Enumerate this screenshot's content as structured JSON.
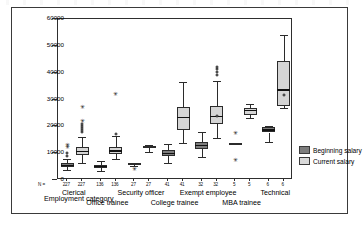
{
  "figure": {
    "xaxis_title": "Employment category",
    "n_prefix": "N ="
  },
  "legend": {
    "items": [
      {
        "label": "Beginning salary",
        "color": "#7d7d7d"
      },
      {
        "label": "Current salary",
        "color": "#d9d9d9"
      }
    ]
  },
  "chart_data": {
    "type": "box",
    "title": "",
    "xlabel": "Employment category",
    "ylabel": "",
    "ylim": [
      0,
      60000
    ],
    "yticks": [
      0,
      10000,
      20000,
      30000,
      40000,
      50000,
      60000
    ],
    "ytick_labels": [
      "0",
      "10000",
      "20000",
      "30000",
      "40000",
      "50000",
      "60000"
    ],
    "grid": false,
    "legend_position": "right",
    "categories": [
      "Clerical",
      "Office trainee",
      "Security officer",
      "College trainee",
      "Exempt employee",
      "MBA trainee",
      "Technical"
    ],
    "counts": [
      227,
      136,
      27,
      41,
      32,
      5,
      6
    ],
    "series": [
      {
        "name": "Beginning salary",
        "color": "#7d7d7d",
        "boxes": [
          {
            "category": "Clerical",
            "n": 227,
            "whisker_low": 3600,
            "q1": 4800,
            "median": 5400,
            "q3": 6300,
            "whisker_high": 8000,
            "outliers": [
              9000,
              10200,
              11800,
              12600
            ]
          },
          {
            "category": "Office trainee",
            "n": 136,
            "whisker_low": 3400,
            "q1": 4500,
            "median": 5100,
            "q3": 5700,
            "whisker_high": 7000,
            "outliers": []
          },
          {
            "category": "Security officer",
            "n": 27,
            "whisker_low": 5300,
            "q1": 5700,
            "median": 5900,
            "q3": 6100,
            "whisker_high": 6400,
            "outliers": [
              3800
            ]
          },
          {
            "category": "College trainee",
            "n": 41,
            "whisker_low": 6200,
            "q1": 8900,
            "median": 9800,
            "q3": 11200,
            "whisker_high": 13300,
            "outliers": []
          },
          {
            "category": "Exempt employee",
            "n": 32,
            "whisker_low": 8600,
            "q1": 11600,
            "median": 12800,
            "q3": 14200,
            "whisker_high": 17800,
            "outliers": []
          },
          {
            "category": "MBA trainee",
            "n": 5,
            "whisker_low": 13300,
            "q1": 13300,
            "median": 13400,
            "q3": 13500,
            "whisker_high": 13500,
            "outliers": [
              17000,
              7000
            ]
          },
          {
            "category": "Technical",
            "n": 6,
            "whisker_low": 14000,
            "q1": 17700,
            "median": 18600,
            "q3": 19800,
            "whisker_high": 20000,
            "outliers": []
          }
        ]
      },
      {
        "name": "Current salary",
        "color": "#d9d9d9",
        "boxes": [
          {
            "category": "Clerical",
            "n": 227,
            "whisker_low": 6500,
            "q1": 9400,
            "median": 10600,
            "q3": 12200,
            "whisker_high": 16000,
            "outliers": [
              17800,
              18600,
              19300,
              20000,
              20800,
              21500,
              26800
            ]
          },
          {
            "category": "Office trainee",
            "n": 136,
            "whisker_low": 7800,
            "q1": 9600,
            "median": 10700,
            "q3": 12200,
            "whisker_high": 16400,
            "outliers": [
              17300,
              31800
            ]
          },
          {
            "category": "Security officer",
            "n": 27,
            "whisker_low": 10400,
            "q1": 11800,
            "median": 12200,
            "q3": 12600,
            "whisker_high": 13100,
            "outliers": []
          },
          {
            "category": "College trainee",
            "n": 41,
            "whisker_low": 13800,
            "q1": 18600,
            "median": 23300,
            "q3": 27100,
            "whisker_high": 36500,
            "outliers": []
          },
          {
            "category": "Exempt employee",
            "n": 32,
            "whisker_low": 15600,
            "q1": 20700,
            "median": 23700,
            "q3": 27600,
            "whisker_high": 36900,
            "outliers": [
              23900,
              39300,
              40200,
              41200,
              42100
            ]
          },
          {
            "category": "MBA trainee",
            "n": 5,
            "whisker_low": 23100,
            "q1": 24300,
            "median": 25900,
            "q3": 26800,
            "whisker_high": 28300,
            "outliers": []
          },
          {
            "category": "Technical",
            "n": 6,
            "whisker_low": 26700,
            "q1": 27600,
            "median": 33500,
            "q3": 44200,
            "whisker_high": 53900,
            "outliers": [
              31700
            ]
          }
        ]
      }
    ]
  }
}
